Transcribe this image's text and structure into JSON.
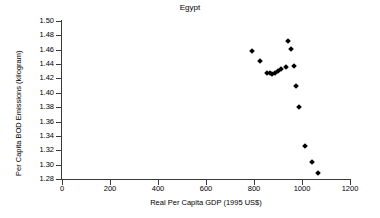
{
  "chart_data": {
    "type": "scatter",
    "title": "Egypt",
    "xlabel": "Real Per Capita GDP (1995 US$)",
    "ylabel": "Per Capita BOD Emissions (kilogram)",
    "xlim": [
      0,
      1200
    ],
    "ylim": [
      1.28,
      1.5
    ],
    "xticks": [
      0,
      200,
      400,
      600,
      800,
      1000,
      1200
    ],
    "xtick_labels": [
      "0",
      "200",
      "400",
      "600",
      "800",
      "1000",
      "1200"
    ],
    "yticks": [
      1.28,
      1.3,
      1.32,
      1.34,
      1.36,
      1.38,
      1.4,
      1.42,
      1.44,
      1.46,
      1.48,
      1.5
    ],
    "ytick_labels": [
      "1.28",
      "1.30",
      "1.32",
      "1.34",
      "1.36",
      "1.38",
      "1.40",
      "1.42",
      "1.44",
      "1.46",
      "1.48",
      "1.50"
    ],
    "grid": false,
    "legend": false,
    "marker": "filled-diamond",
    "marker_color": "#000000",
    "series": [
      {
        "name": "Egypt",
        "points": [
          [
            790,
            1.458
          ],
          [
            824,
            1.445
          ],
          [
            855,
            1.428
          ],
          [
            866,
            1.428
          ],
          [
            876,
            1.426
          ],
          [
            887,
            1.427
          ],
          [
            900,
            1.43
          ],
          [
            914,
            1.433
          ],
          [
            934,
            1.436
          ],
          [
            940,
            1.472
          ],
          [
            955,
            1.461
          ],
          [
            966,
            1.437
          ],
          [
            976,
            1.41
          ],
          [
            986,
            1.38
          ],
          [
            1011,
            1.326
          ],
          [
            1040,
            1.304
          ],
          [
            1066,
            1.289
          ]
        ]
      }
    ]
  }
}
